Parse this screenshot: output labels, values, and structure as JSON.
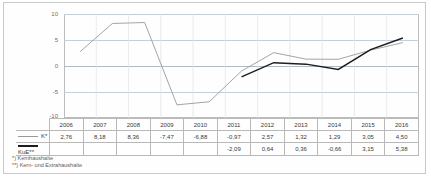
{
  "chart_data": {
    "type": "line",
    "title": "",
    "xlabel": "",
    "ylabel": "",
    "ylim": [
      -10,
      10
    ],
    "yticks": [
      "10",
      "5",
      "0",
      "-5",
      "-10"
    ],
    "grid": true,
    "legend_position": "table-row-labels",
    "categories": [
      "2006",
      "2007",
      "2008",
      "2009",
      "2010",
      "2011",
      "2012",
      "2013",
      "2014",
      "2015",
      "2016"
    ],
    "series": [
      {
        "name": "K*",
        "color": "#9a9a9a",
        "values": [
          2.76,
          8.18,
          8.36,
          -7.47,
          -6.88,
          -0.97,
          2.57,
          1.32,
          1.29,
          3.05,
          4.5
        ],
        "labels": [
          "2,76",
          "8,18",
          "8,36",
          "-7,47",
          "-6,88",
          "-0,97",
          "2,57",
          "1,32",
          "1,29",
          "3,05",
          "4,50"
        ]
      },
      {
        "name": "KuE**",
        "color": "#1d1d1d",
        "values": [
          null,
          null,
          null,
          null,
          null,
          -2.09,
          0.64,
          0.36,
          -0.66,
          3.15,
          5.38
        ],
        "labels": [
          "",
          "",
          "",
          "",
          "",
          "-2,09",
          "0,64",
          "0,36",
          "-0,66",
          "3,15",
          "5,38"
        ]
      }
    ]
  },
  "table": {
    "header": [
      "2006",
      "2007",
      "2008",
      "2009",
      "2010",
      "2011",
      "2012",
      "2013",
      "2014",
      "2015",
      "2016"
    ],
    "rows": [
      {
        "label": "K*",
        "swatch": "line-grey-icon",
        "cells": [
          "2,76",
          "8,18",
          "8,36",
          "-7,47",
          "-6,88",
          "-0,97",
          "2,57",
          "1,32",
          "1,29",
          "3,05",
          "4,50"
        ]
      },
      {
        "label": "KuE**",
        "swatch": "line-black-icon",
        "cells": [
          "",
          "",
          "",
          "",
          "",
          "-2,09",
          "0,64",
          "0,36",
          "-0,66",
          "3,15",
          "5,38"
        ]
      }
    ]
  },
  "footnotes": [
    "*) Kernhaushalte",
    "**) Kern- und Extrahaushalte"
  ],
  "axis": {
    "y_labels": [
      "10",
      "5",
      "0",
      "-5",
      "-10"
    ]
  }
}
